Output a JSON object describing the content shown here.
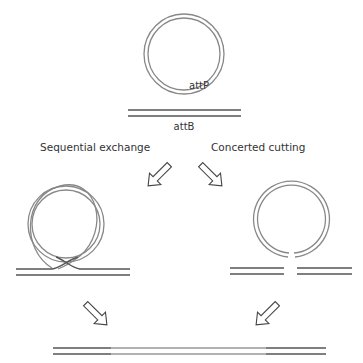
{
  "diagram": {
    "top_plasmid_label": "attP",
    "top_linear_label": "attB",
    "left_pathway_label": "Sequential exchange",
    "right_pathway_label": "Concerted cutting"
  },
  "colors": {
    "dark_strand": "#555555",
    "light_strand": "#999999",
    "arrow_stroke": "#444444"
  }
}
